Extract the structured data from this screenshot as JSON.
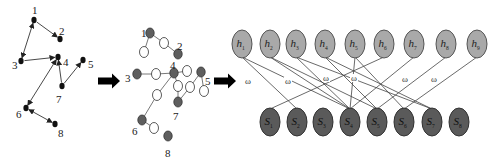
{
  "colors": {
    "edge": "#333333",
    "black_node": "#111111",
    "gray_node": "#5e5e5e",
    "white_node": "#ffffff",
    "hidden_fill": "#a9a9a9",
    "hidden_stroke": "#555555",
    "visible_fill": "#5a5a5a",
    "visible_stroke": "#333333",
    "arrow": "#000000"
  },
  "graph_original": {
    "nodes": [
      {
        "id": "1",
        "x": 34,
        "y": 20,
        "lx": 32,
        "ly": 10
      },
      {
        "id": "2",
        "x": 60,
        "y": 39,
        "lx": 59,
        "ly": 31
      },
      {
        "id": "3",
        "x": 21,
        "y": 61,
        "lx": 12,
        "ly": 65
      },
      {
        "id": "4",
        "x": 58,
        "y": 57,
        "lx": 63,
        "ly": 62
      },
      {
        "id": "5",
        "x": 83,
        "y": 60,
        "lx": 88,
        "ly": 64
      },
      {
        "id": "6",
        "x": 26,
        "y": 108,
        "lx": 16,
        "ly": 114
      },
      {
        "id": "7",
        "x": 62,
        "y": 86,
        "lx": 56,
        "ly": 99
      },
      {
        "id": "8",
        "x": 55,
        "y": 124,
        "lx": 58,
        "ly": 133
      }
    ],
    "edges": [
      {
        "from": "1",
        "to": "2",
        "dir": "to"
      },
      {
        "from": "1",
        "to": "3",
        "dir": "both"
      },
      {
        "from": "3",
        "to": "4",
        "dir": "to"
      },
      {
        "from": "7",
        "to": "4",
        "dir": "to"
      },
      {
        "from": "7",
        "to": "5",
        "dir": "to"
      },
      {
        "from": "4",
        "to": "6",
        "dir": "both"
      },
      {
        "from": "6",
        "to": "8",
        "dir": "both"
      }
    ]
  },
  "graph_expanded": {
    "nodes": [
      {
        "id": "1",
        "x": 150,
        "y": 33,
        "type": "gray",
        "label": "1",
        "lx": 141,
        "ly": 33
      },
      {
        "id": "w1",
        "x": 164,
        "y": 43,
        "type": "white"
      },
      {
        "id": "w2",
        "x": 144,
        "y": 52,
        "type": "white"
      },
      {
        "id": "2",
        "x": 178,
        "y": 54,
        "type": "gray",
        "label": "2",
        "lx": 177,
        "ly": 46
      },
      {
        "id": "3",
        "x": 137,
        "y": 74,
        "type": "gray",
        "label": "3",
        "lx": 125,
        "ly": 78
      },
      {
        "id": "w3",
        "x": 156,
        "y": 74,
        "type": "white"
      },
      {
        "id": "4",
        "x": 174,
        "y": 73,
        "type": "gray",
        "label": "4",
        "lx": 170,
        "ly": 65
      },
      {
        "id": "w4",
        "x": 187,
        "y": 71,
        "type": "white"
      },
      {
        "id": "5",
        "x": 201,
        "y": 72,
        "type": "gray",
        "label": "5",
        "lx": 205,
        "ly": 81
      },
      {
        "id": "w5",
        "x": 204,
        "y": 91,
        "type": "white"
      },
      {
        "id": "w6",
        "x": 190,
        "y": 87,
        "type": "white"
      },
      {
        "id": "w7",
        "x": 178,
        "y": 86,
        "type": "white"
      },
      {
        "id": "7",
        "x": 178,
        "y": 102,
        "type": "gray",
        "label": "7",
        "lx": 173,
        "ly": 116
      },
      {
        "id": "w8",
        "x": 157,
        "y": 95,
        "type": "white"
      },
      {
        "id": "6",
        "x": 142,
        "y": 120,
        "type": "gray",
        "label": "6",
        "lx": 132,
        "ly": 131
      },
      {
        "id": "w9",
        "x": 154,
        "y": 128,
        "type": "white"
      },
      {
        "id": "8",
        "x": 168,
        "y": 136,
        "type": "gray",
        "label": "8",
        "lx": 165,
        "ly": 153
      }
    ],
    "edges": [
      [
        "1",
        "w1"
      ],
      [
        "1",
        "w2"
      ],
      [
        "w1",
        "2"
      ],
      [
        "3",
        "w3"
      ],
      [
        "w3",
        "4"
      ],
      [
        "4",
        "w4"
      ],
      [
        "4",
        "w7"
      ],
      [
        "w7",
        "7"
      ],
      [
        "7",
        "w6"
      ],
      [
        "w6",
        "5"
      ],
      [
        "5",
        "w5"
      ],
      [
        "4",
        "w8"
      ],
      [
        "w8",
        "6"
      ],
      [
        "6",
        "w9"
      ]
    ]
  },
  "arrows": [
    {
      "x": 98,
      "y": 81,
      "w": 22
    },
    {
      "x": 214,
      "y": 81,
      "w": 22
    }
  ],
  "bipartite": {
    "hidden_y": 44,
    "visible_y": 122,
    "rx": 10,
    "ry": 14,
    "hidden": [
      {
        "name": "h",
        "sub": "1",
        "x": 242
      },
      {
        "name": "h",
        "sub": "2",
        "x": 270
      },
      {
        "name": "h",
        "sub": "3",
        "x": 296
      },
      {
        "name": "h",
        "sub": "4",
        "x": 325
      },
      {
        "name": "h",
        "sub": "5",
        "x": 355
      },
      {
        "name": "h",
        "sub": "6",
        "x": 384
      },
      {
        "name": "h",
        "sub": "7",
        "x": 414
      },
      {
        "name": "h",
        "sub": "8",
        "x": 446
      },
      {
        "name": "h",
        "sub": "9",
        "x": 477
      }
    ],
    "visible": [
      {
        "name": "S",
        "sub": "1",
        "x": 270
      },
      {
        "name": "S",
        "sub": "2",
        "x": 297
      },
      {
        "name": "S",
        "sub": "3",
        "x": 323
      },
      {
        "name": "S",
        "sub": "4",
        "x": 350
      },
      {
        "name": "S",
        "sub": "5",
        "x": 377
      },
      {
        "name": "S",
        "sub": "6",
        "x": 404
      },
      {
        "name": "S",
        "sub": "7",
        "x": 432
      },
      {
        "name": "S",
        "sub": "8",
        "x": 459
      }
    ],
    "edges": [
      [
        0,
        1
      ],
      [
        0,
        3
      ],
      [
        1,
        3
      ],
      [
        1,
        4
      ],
      [
        2,
        3
      ],
      [
        2,
        6
      ],
      [
        3,
        4
      ],
      [
        3,
        6
      ],
      [
        4,
        5
      ],
      [
        4,
        3
      ],
      [
        5,
        0
      ],
      [
        6,
        3
      ],
      [
        7,
        4
      ],
      [
        8,
        5
      ]
    ],
    "weight_symbol": "ω",
    "weight_labels": [
      {
        "x": 248,
        "y": 84
      },
      {
        "x": 288,
        "y": 84
      },
      {
        "x": 326,
        "y": 81
      },
      {
        "x": 354,
        "y": 81
      },
      {
        "x": 405,
        "y": 82
      },
      {
        "x": 434,
        "y": 82
      }
    ]
  }
}
